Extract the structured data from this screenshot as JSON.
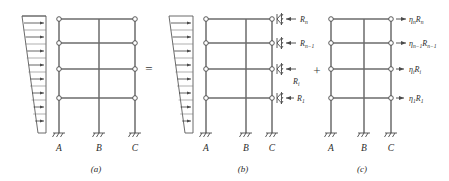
{
  "figure": {
    "type": "structural-frame-load-decomposition",
    "operators": {
      "equals": "=",
      "plus": "+"
    },
    "stroke_color": "#555555",
    "text_color": "#2b2b2b"
  },
  "panels": [
    {
      "id": "a",
      "caption": "(a)",
      "has_triangular_load": true,
      "load_arrow_count": 8,
      "supports": [
        {
          "label": "A"
        },
        {
          "label": "B"
        },
        {
          "label": "C"
        }
      ],
      "force_labels": []
    },
    {
      "id": "b",
      "caption": "(b)",
      "has_triangular_load": true,
      "load_arrow_count": 8,
      "supports": [
        {
          "label": "A"
        },
        {
          "label": "B"
        },
        {
          "label": "C"
        }
      ],
      "force_labels": [
        {
          "base": "R",
          "sub": "n"
        },
        {
          "base": "R",
          "sub": "n−1"
        },
        {
          "base": "R",
          "sub": "i"
        },
        {
          "base": "R",
          "sub": "1"
        }
      ]
    },
    {
      "id": "c",
      "caption": "(c)",
      "has_triangular_load": false,
      "load_arrow_count": 0,
      "supports": [
        {
          "label": "A"
        },
        {
          "label": "B"
        },
        {
          "label": "C"
        }
      ],
      "force_labels": [
        {
          "eta": "η",
          "eta_sub": "n",
          "base": "R",
          "sub": "n"
        },
        {
          "eta": "η",
          "eta_sub": "n−1",
          "base": "R",
          "sub": "n−1"
        },
        {
          "eta": "η",
          "eta_sub": "i",
          "base": "R",
          "sub": "i"
        },
        {
          "eta": "η",
          "eta_sub": "1",
          "base": "R",
          "sub": "1"
        }
      ]
    }
  ]
}
